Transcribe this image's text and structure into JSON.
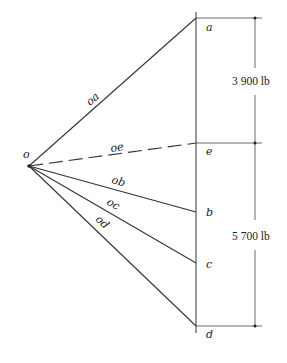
{
  "diagram": {
    "type": "force-polygon",
    "pole": "o",
    "points": [
      "a",
      "e",
      "b",
      "c",
      "d"
    ],
    "rays": [
      {
        "label": "oa",
        "style": "solid"
      },
      {
        "label": "oe",
        "style": "dashed"
      },
      {
        "label": "ob",
        "style": "solid"
      },
      {
        "label": "oc",
        "style": "solid"
      },
      {
        "label": "od",
        "style": "solid"
      }
    ],
    "dimensions": [
      {
        "label": "3 900 lb",
        "from": "a",
        "to": "e"
      },
      {
        "label": "5 700 lb",
        "from": "e",
        "to": "d"
      }
    ],
    "labels": {
      "o": "o",
      "a": "a",
      "e": "e",
      "b": "b",
      "c": "c",
      "d": "d",
      "oa": "oa",
      "oe": "oe",
      "ob": "ob",
      "oc": "oc",
      "od": "od",
      "dim1": "3 900 lb",
      "dim2": "5 700 lb"
    }
  }
}
